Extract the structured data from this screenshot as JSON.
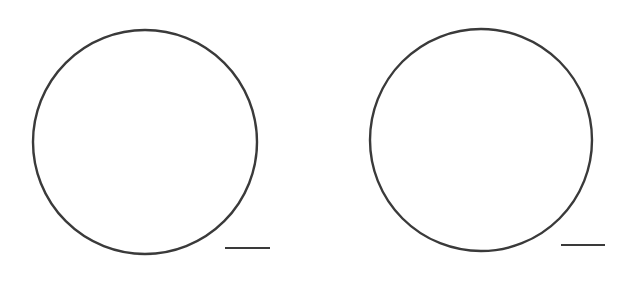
{
  "figures": [
    {
      "name": "left",
      "circle": {
        "cx": 145,
        "cy": 142,
        "r": 112
      },
      "line": {
        "x1": 225,
        "x2": 270,
        "y": 248
      }
    },
    {
      "name": "right",
      "circle": {
        "cx": 481,
        "cy": 140,
        "r": 111
      },
      "line": {
        "x1": 561,
        "x2": 605,
        "y": 245
      }
    }
  ],
  "style": {
    "stroke": "#3a3a3a",
    "stroke_width": 2.4,
    "background": "#ffffff"
  }
}
